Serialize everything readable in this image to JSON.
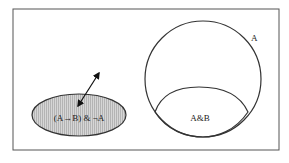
{
  "diagram": {
    "frame": {
      "stroke": "#555555"
    },
    "ellipse": {
      "label": "(A→B) & ¬A",
      "fill": "#c8c8c8",
      "stroke": "#333333"
    },
    "circle": {
      "label": "A"
    },
    "intersection": {
      "label": "A&B"
    },
    "arrow": {
      "type": "double-headed"
    }
  }
}
